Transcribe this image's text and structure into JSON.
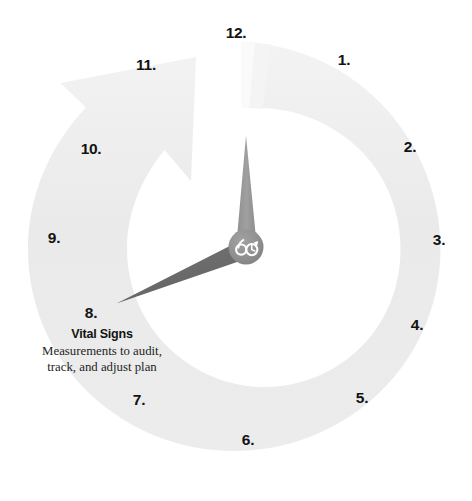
{
  "diagram": {
    "type": "clock-face-cycle",
    "title": "Vital Signs",
    "center_logo_text": "60",
    "colors": {
      "background": "#ffffff",
      "arc_band": "#ebebeb",
      "arc_band_light": "#f2f2f2",
      "minute_hand": "#9a9a9a",
      "hour_hand": "#6e6e6e",
      "hub": "#8a8a8a",
      "logo_mark": "#ffffff",
      "number_text": "#131313",
      "description_text": "#231f1f"
    },
    "hands": {
      "minute_hand_points_to": "12",
      "hour_hand_points_to": "8"
    },
    "hours": [
      {
        "label": "12.",
        "x": 236,
        "y": 33
      },
      {
        "label": "1.",
        "x": 344,
        "y": 60
      },
      {
        "label": "2.",
        "x": 410,
        "y": 147
      },
      {
        "label": "3.",
        "x": 439,
        "y": 240
      },
      {
        "label": "4.",
        "x": 417,
        "y": 325
      },
      {
        "label": "5.",
        "x": 362,
        "y": 398
      },
      {
        "label": "6.",
        "x": 248,
        "y": 440
      },
      {
        "label": "7.",
        "x": 139,
        "y": 400
      },
      {
        "label": "8.",
        "x": 91,
        "y": 313
      },
      {
        "label": "9.",
        "x": 54,
        "y": 238
      },
      {
        "label": "10.",
        "x": 91,
        "y": 149
      },
      {
        "label": "11.",
        "x": 146,
        "y": 65
      }
    ],
    "caption": {
      "step_number": "8.",
      "title": "Vital Signs",
      "description_line_1": "Measurements to audit,",
      "description_line_2": "track, and adjust plan"
    },
    "icons": {
      "arrow": "curved-arrow-icon",
      "minute_hand": "clock-minute-hand-icon",
      "hour_hand": "clock-hour-hand-icon",
      "logo": "sixty-clock-logo-icon"
    }
  }
}
